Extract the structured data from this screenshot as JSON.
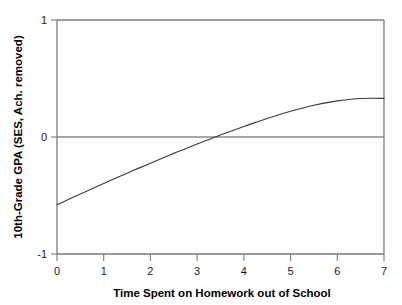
{
  "chart_data": {
    "type": "line",
    "title": "",
    "xlabel": "Time Spent on Homework out of School",
    "ylabel": "10th-Grade GPA (SES, Ach. removed)",
    "xlim": [
      0,
      7
    ],
    "ylim": [
      -1,
      1
    ],
    "xticks": [
      "0",
      "1",
      "2",
      "3",
      "4",
      "5",
      "6",
      "7"
    ],
    "yticks": [
      "1",
      "0",
      "-1"
    ],
    "grid": false,
    "legend": "none",
    "reference_lines": [
      {
        "axis": "y",
        "value": 0,
        "color": "#8a8a8a"
      }
    ],
    "series": [
      {
        "name": "Predicted 10th-Grade GPA",
        "color": "#3a3a3a",
        "x": [
          0,
          0.25,
          0.5,
          0.75,
          1,
          1.25,
          1.5,
          1.75,
          2,
          2.25,
          2.5,
          2.75,
          3,
          3.25,
          3.5,
          3.75,
          4,
          4.25,
          4.5,
          4.75,
          5,
          5.15,
          5.25,
          5.5,
          5.75,
          6,
          6.25,
          6.5,
          6.75,
          7
        ],
        "values": [
          -0.58,
          -0.533,
          -0.487,
          -0.442,
          -0.397,
          -0.353,
          -0.309,
          -0.266,
          -0.224,
          -0.182,
          -0.14,
          -0.1,
          -0.06,
          -0.021,
          0.017,
          0.054,
          0.09,
          0.125,
          0.158,
          0.19,
          0.22,
          0.237,
          0.247,
          0.271,
          0.292,
          0.309,
          0.321,
          0.329,
          0.331,
          0.33
        ]
      }
    ],
    "annotations": {
      "start_point": {
        "x": 0,
        "y": -0.58
      },
      "zero_crossing": {
        "x": 2.0,
        "y": 0
      },
      "peak": {
        "x": 5.15,
        "y": 0.35
      },
      "end_point": {
        "x": 7,
        "y": 0.23
      }
    }
  },
  "colors": {
    "axis": "#7a7a7a",
    "curve": "#3a3a3a",
    "zero_line": "#8a8a8a",
    "text": "#000000",
    "background": "#ffffff"
  }
}
